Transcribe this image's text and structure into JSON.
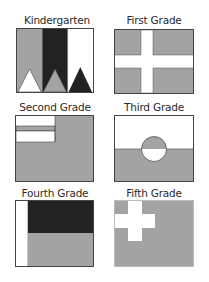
{
  "colors": {
    "gray": "#a3a3a3",
    "black": "#222222",
    "white": "#ffffff",
    "border": "#444444"
  },
  "flags": [
    {
      "id": "kindergarten",
      "label": "Kindergarten",
      "description": "Three vertical stripes (gray, black, white) each with a triangle at the bottom (white, gray, black)"
    },
    {
      "id": "first-grade",
      "label": "First Grade",
      "description": "Gray field with white cross"
    },
    {
      "id": "second-grade",
      "label": "Second Grade",
      "description": "Gray field with canton of white, gray, white horizontal stripes"
    },
    {
      "id": "third-grade",
      "label": "Third Grade",
      "description": "Horizontal white over gray with counter-colored circle in center"
    },
    {
      "id": "fourth-grade",
      "label": "Fourth Grade",
      "description": "White vertical band at hoist; black over gray horizontal fields"
    },
    {
      "id": "fifth-grade",
      "label": "Fifth Grade",
      "description": "Gray field with white cross in upper hoist"
    }
  ]
}
